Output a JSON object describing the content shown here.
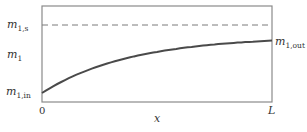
{
  "chart_data": {
    "type": "line",
    "title": "",
    "xlabel": "x",
    "ylabel": "m1",
    "x_ticks": [
      "0",
      "L"
    ],
    "y_tick_labels": [
      {
        "main": "m",
        "sub": "1,s",
        "role": "saturation-level"
      },
      {
        "main": "m",
        "sub": "1,in",
        "role": "inlet-value"
      }
    ],
    "right_label": {
      "main": "m",
      "sub": "1,out",
      "role": "outlet-value"
    },
    "grid": false,
    "legend": null,
    "series": [
      {
        "name": "m1(x)",
        "style": "solid",
        "x": [
          0,
          0.1,
          0.2,
          0.3,
          0.4,
          0.5,
          0.6,
          0.7,
          0.8,
          0.9,
          1.0
        ],
        "values": [
          0.0,
          0.17,
          0.31,
          0.43,
          0.52,
          0.6,
          0.66,
          0.71,
          0.74,
          0.76,
          0.77
        ]
      },
      {
        "name": "m1,s",
        "style": "dashed",
        "x": [
          0,
          1.0
        ],
        "values": [
          1.0,
          1.0
        ]
      }
    ],
    "xlim": [
      0,
      1.0
    ],
    "ylim": [
      -0.12,
      1.28
    ]
  },
  "labels": {
    "ms_main": "m",
    "ms_sub": "1,s",
    "m1_main": "m",
    "m1_sub": "1",
    "min_main": "m",
    "min_sub": "1,in",
    "mout_main": "m",
    "mout_sub": "1,out",
    "x_zero": "0",
    "x_end": "L",
    "x_axis": "x"
  },
  "colors": {
    "frame": "#8a8a8a",
    "curve": "#4a4a4a",
    "dashed": "#7a7a7a",
    "text": "#333333"
  }
}
